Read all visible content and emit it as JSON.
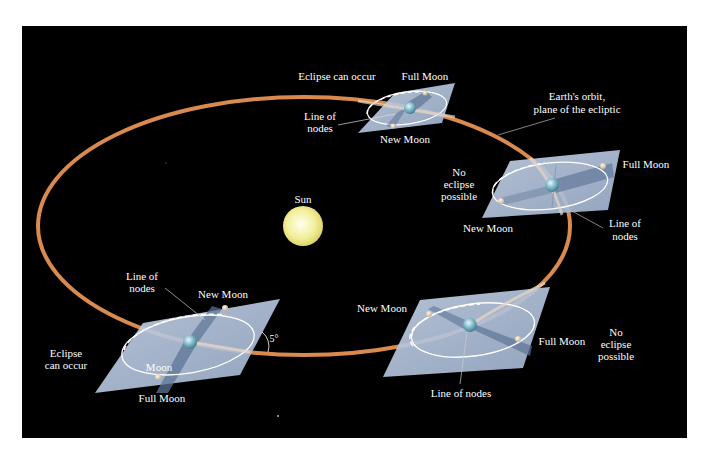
{
  "diagram": {
    "background_color": "#000000",
    "orbit_color": "#d98a4e",
    "plane_color": "#b4c4dc",
    "sun_color": "#f2ee9a",
    "sun": {
      "label": "Sun"
    },
    "orbit_label": {
      "line1": "Earth's orbit,",
      "line2": "plane of the ecliptic"
    },
    "positions": [
      {
        "id": "top",
        "condition": "Eclipse can occur",
        "full_moon": "Full Moon",
        "new_moon": "New Moon",
        "line_of_nodes": {
          "line1": "Line of",
          "line2": "nodes"
        }
      },
      {
        "id": "right",
        "condition": {
          "line1": "No",
          "line2": "eclipse",
          "line3": "possible"
        },
        "full_moon": "Full Moon",
        "new_moon": "New Moon",
        "line_of_nodes": {
          "line1": "Line of",
          "line2": "nodes"
        }
      },
      {
        "id": "bottom-left",
        "condition": {
          "line1": "Eclipse",
          "line2": "can occur"
        },
        "full_moon": "Full Moon",
        "new_moon": "New Moon",
        "moon": "Moon",
        "line_of_nodes": {
          "line1": "Line of",
          "line2": "nodes"
        },
        "inclination": "5°"
      },
      {
        "id": "bottom-right",
        "condition": {
          "line1": "No",
          "line2": "eclipse",
          "line3": "possible"
        },
        "full_moon": "Full Moon",
        "new_moon": "New Moon",
        "line_of_nodes": "Line of nodes"
      }
    ]
  }
}
